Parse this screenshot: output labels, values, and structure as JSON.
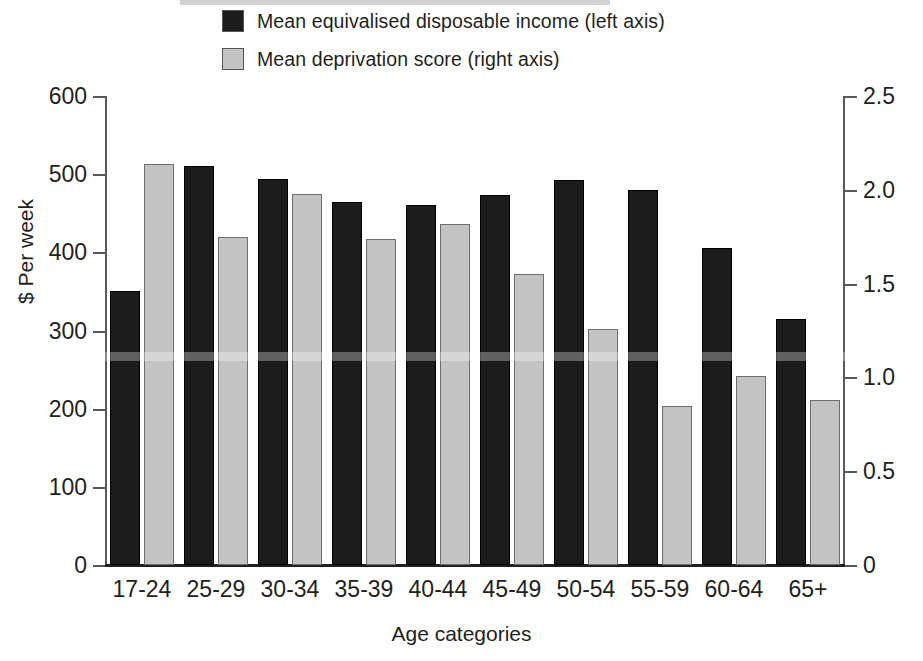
{
  "chart_data": {
    "type": "bar",
    "title": "",
    "xlabel": "Age categories",
    "ylabel": "$ Per week",
    "y2label": "",
    "categories": [
      "17-24",
      "25-29",
      "30-34",
      "35-39",
      "40-44",
      "45-49",
      "50-54",
      "55-59",
      "60-64",
      "65+"
    ],
    "series": [
      {
        "name": "Mean equivalised disposable income (left axis)",
        "axis": "left",
        "color": "#1c1c1c",
        "values": [
          351,
          510,
          494,
          465,
          461,
          474,
          492,
          480,
          406,
          315
        ]
      },
      {
        "name": "Mean deprivation score (right axis)",
        "axis": "right",
        "color": "#c4c4c4",
        "values": [
          2.14,
          1.75,
          1.98,
          1.74,
          1.82,
          1.55,
          1.26,
          0.85,
          1.01,
          0.88
        ]
      }
    ],
    "ylim": [
      0,
      600
    ],
    "y2lim": [
      0,
      2.5
    ],
    "yticks": [
      "0",
      "100",
      "200",
      "300",
      "400",
      "500",
      "600"
    ],
    "ytick_values": [
      0,
      100,
      200,
      300,
      400,
      500,
      600
    ],
    "y2ticks": [
      "0",
      "0.5",
      "1.0",
      "1.5",
      "2.0",
      "2.5"
    ],
    "y2tick_values": [
      0,
      0.5,
      1.0,
      1.5,
      2.0,
      2.5
    ],
    "grid": false,
    "legend_position": "top-center"
  },
  "legend": {
    "items": [
      {
        "label": "Mean equivalised disposable income (left axis)",
        "swatch": "dark-swatch",
        "color": "#1c1c1c"
      },
      {
        "label": "Mean deprivation score (right axis)",
        "swatch": "light-swatch",
        "color": "#c4c4c4"
      }
    ]
  },
  "axes": {
    "x_title": "Age categories",
    "y_title": "$ Per week"
  }
}
